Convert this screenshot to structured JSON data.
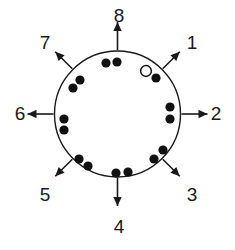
{
  "figure": {
    "type": "diagram",
    "background_color": "#ffffff",
    "stroke_color": "#1a1a1a",
    "marker_fill_color": "#111111",
    "marker_open_fill_color": "#ffffff"
  },
  "circle": {
    "center_x": 117.5,
    "center_y": 114,
    "radius": 63,
    "stroke_width": 1.4
  },
  "directions": [
    {
      "id": "dir-1",
      "label": "1",
      "angle_deg": 45,
      "label_x": 192,
      "label_y": 44,
      "shaft_inner": 64,
      "shaft_outer": 88
    },
    {
      "id": "dir-2",
      "label": "2",
      "angle_deg": 0,
      "label_x": 216,
      "label_y": 115,
      "shaft_inner": 64,
      "shaft_outer": 90
    },
    {
      "id": "dir-3",
      "label": "3",
      "angle_deg": -45,
      "label_x": 192,
      "label_y": 196,
      "shaft_inner": 64,
      "shaft_outer": 88
    },
    {
      "id": "dir-4",
      "label": "4",
      "angle_deg": -90,
      "label_x": 119,
      "label_y": 228,
      "shaft_inner": 64,
      "shaft_outer": 92
    },
    {
      "id": "dir-5",
      "label": "5",
      "angle_deg": -135,
      "label_x": 45,
      "label_y": 196,
      "shaft_inner": 64,
      "shaft_outer": 88
    },
    {
      "id": "dir-6",
      "label": "6",
      "angle_deg": 180,
      "label_x": 20,
      "label_y": 115,
      "shaft_inner": 64,
      "shaft_outer": 90
    },
    {
      "id": "dir-7",
      "label": "7",
      "angle_deg": 135,
      "label_x": 45,
      "label_y": 44,
      "shaft_inner": 64,
      "shaft_outer": 88
    },
    {
      "id": "dir-8",
      "label": "8",
      "angle_deg": 90,
      "label_x": 119,
      "label_y": 17,
      "shaft_inner": 64,
      "shaft_outer": 92
    }
  ],
  "markers": {
    "count_filled": 14,
    "count_open": 1,
    "radius_filled": 4.6,
    "radius_open": 5.4,
    "points": [
      {
        "id": "marker-1",
        "x": 106,
        "y": 63,
        "type": "filled"
      },
      {
        "id": "marker-2",
        "x": 117,
        "y": 62,
        "type": "filled"
      },
      {
        "id": "marker-3",
        "x": 146,
        "y": 71,
        "type": "open"
      },
      {
        "id": "marker-4",
        "x": 156,
        "y": 78,
        "type": "filled"
      },
      {
        "id": "marker-5",
        "x": 170,
        "y": 107,
        "type": "filled"
      },
      {
        "id": "marker-6",
        "x": 170,
        "y": 119,
        "type": "filled"
      },
      {
        "id": "marker-7",
        "x": 163,
        "y": 150,
        "type": "filled"
      },
      {
        "id": "marker-8",
        "x": 154,
        "y": 159,
        "type": "filled"
      },
      {
        "id": "marker-9",
        "x": 116,
        "y": 173,
        "type": "filled"
      },
      {
        "id": "marker-10",
        "x": 128,
        "y": 172,
        "type": "filled"
      },
      {
        "id": "marker-11",
        "x": 88,
        "y": 166,
        "type": "filled"
      },
      {
        "id": "marker-12",
        "x": 79,
        "y": 159,
        "type": "filled"
      },
      {
        "id": "marker-13",
        "x": 64,
        "y": 119,
        "type": "filled"
      },
      {
        "id": "marker-14",
        "x": 64,
        "y": 130,
        "type": "filled"
      },
      {
        "id": "marker-15",
        "x": 80,
        "y": 80,
        "type": "filled"
      },
      {
        "id": "marker-16",
        "x": 73,
        "y": 88,
        "type": "filled"
      }
    ]
  }
}
